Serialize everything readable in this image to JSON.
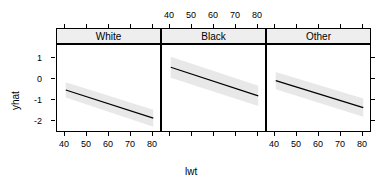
{
  "chart_data": {
    "type": "line",
    "title": "",
    "subtitle": "",
    "xlabel": "lwt",
    "ylabel": "yhat",
    "xlim": [
      36,
      84
    ],
    "ylim": [
      -2.55,
      1.6
    ],
    "xticks": [
      40,
      50,
      60,
      70,
      80
    ],
    "yticks": [
      1,
      0,
      -1,
      -2
    ],
    "xtick_labels": [
      "40",
      "50",
      "60",
      "70",
      "80"
    ],
    "ytick_labels": [
      "1",
      "0",
      "-1",
      "-2"
    ],
    "grid": false,
    "legend": null,
    "facet_variable": "race",
    "panels": [
      {
        "label": "White",
        "x_axis_side": "bottom",
        "x": [
          40,
          80
        ],
        "y": [
          -0.52,
          -1.85
        ],
        "band_upper": [
          -0.16,
          -1.45
        ],
        "band_lower": [
          -0.88,
          -2.25
        ],
        "slope": -0.0333,
        "intercept": 0.81
      },
      {
        "label": "Black",
        "x_axis_side": "top",
        "x": [
          40,
          80
        ],
        "y": [
          0.55,
          -0.8
        ],
        "band_upper": [
          1.05,
          -0.32
        ],
        "band_lower": [
          0.05,
          -1.28
        ],
        "slope": -0.0338,
        "intercept": 1.9
      },
      {
        "label": "Other",
        "x_axis_side": "bottom",
        "x": [
          40,
          80
        ],
        "y": [
          -0.08,
          -1.35
        ],
        "band_upper": [
          0.33,
          -0.92
        ],
        "band_lower": [
          -0.49,
          -1.78
        ],
        "slope": -0.0318,
        "intercept": 1.19
      }
    ],
    "colors": {
      "line": "#000000",
      "band": "#e8e8e8",
      "strip_background": "#eeeeee",
      "panel_border": "#000000",
      "background": "#ffffff"
    }
  },
  "axis": {
    "x_title": "lwt",
    "y_title": "yhat"
  },
  "strips": [
    {
      "label": "White"
    },
    {
      "label": "Black"
    },
    {
      "label": "Other"
    }
  ],
  "ticks": {
    "x_bottom_white": [
      "40",
      "50",
      "60",
      "70",
      "80"
    ],
    "x_top_black": [
      "40",
      "50",
      "60",
      "70",
      "80"
    ],
    "x_bottom_other": [
      "40",
      "50",
      "60",
      "70",
      "80"
    ],
    "y_left": [
      "1",
      "0",
      "-1",
      "-2"
    ]
  }
}
